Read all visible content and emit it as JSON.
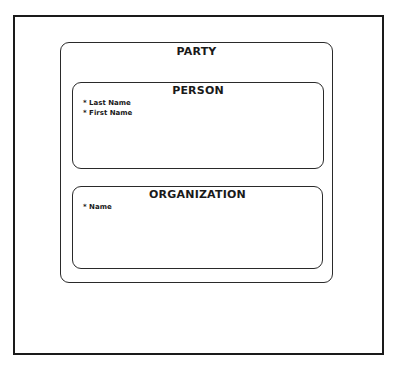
{
  "diagram": {
    "entities": [
      {
        "id": "party",
        "title": "PARTY",
        "attributes": []
      },
      {
        "id": "person",
        "title": "PERSON",
        "attributes": [
          "* Last Name",
          "* First Name"
        ]
      },
      {
        "id": "organization",
        "title": "ORGANIZATION",
        "attributes": [
          "* Name"
        ]
      }
    ],
    "relationships": [
      {
        "type": "subtype",
        "parent": "PARTY",
        "children": [
          "PERSON",
          "ORGANIZATION"
        ]
      }
    ]
  }
}
